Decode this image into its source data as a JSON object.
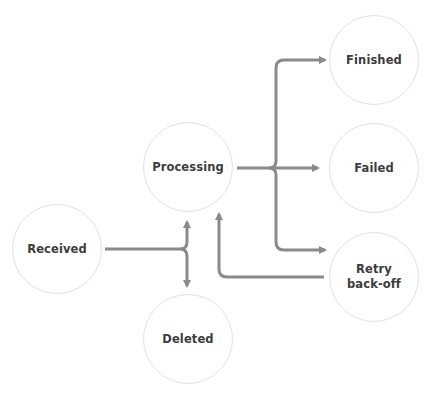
{
  "diagram": {
    "colors": {
      "background": "#ffffff",
      "node_border": "#e2e2e2",
      "node_text": "#3c3c3c",
      "arrow": "#8a8a8a"
    },
    "nodes": [
      {
        "id": "received",
        "label": "Received",
        "cx": 57,
        "cy": 249,
        "r": 45
      },
      {
        "id": "processing",
        "label": "Processing",
        "cx": 188,
        "cy": 167,
        "r": 45
      },
      {
        "id": "deleted",
        "label": "Deleted",
        "cx": 188,
        "cy": 339,
        "r": 45
      },
      {
        "id": "finished",
        "label": "Finished",
        "cx": 374,
        "cy": 60,
        "r": 45
      },
      {
        "id": "failed",
        "label": "Failed",
        "cx": 374,
        "cy": 168,
        "r": 45
      },
      {
        "id": "retry",
        "label": "Retry back-off",
        "cx": 374,
        "cy": 277,
        "r": 45
      }
    ],
    "edges": [
      {
        "from": "received",
        "to": "processing"
      },
      {
        "from": "received",
        "to": "deleted"
      },
      {
        "from": "processing",
        "to": "finished"
      },
      {
        "from": "processing",
        "to": "failed"
      },
      {
        "from": "processing",
        "to": "retry"
      },
      {
        "from": "retry",
        "to": "processing"
      }
    ]
  }
}
